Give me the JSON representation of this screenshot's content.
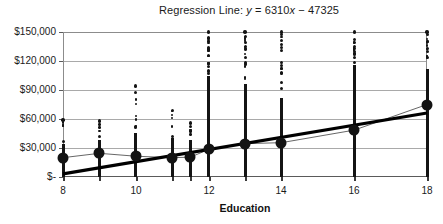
{
  "chart_data": {
    "type": "scatter",
    "title": "Regression Line: y = 6310x − 47325",
    "title_parts": {
      "prefix": "Regression Line: ",
      "y_var": "y",
      "equals": " = 6310",
      "x_var": "x",
      "suffix": " − 47325"
    },
    "xlabel": "Education",
    "ylabel": "",
    "xlim": [
      8,
      18
    ],
    "ylim": [
      0,
      150000
    ],
    "grid": true,
    "legend": false,
    "regression": {
      "slope": 6310,
      "intercept": -47325,
      "equation": "y = 6310x - 47325",
      "x_start": 8,
      "y_start": 3155,
      "x_end": 18,
      "y_end": 66255,
      "color": "#000000"
    },
    "xticks": [
      8,
      10,
      12,
      14,
      16,
      18
    ],
    "xtick_labels": [
      "8",
      "10",
      "12",
      "14",
      "16",
      "18"
    ],
    "xtick_marks_all": [
      8,
      9,
      10,
      11,
      11.5,
      12,
      13,
      14,
      16,
      18
    ],
    "yticks": [
      0,
      30000,
      60000,
      90000,
      120000,
      150000
    ],
    "ytick_labels": [
      "$-",
      "$30,000",
      "$60,000",
      "$90,000",
      "$120,000",
      "$150,000"
    ],
    "means": {
      "name": "Mean earnings by education",
      "x": [
        8,
        9,
        10,
        11,
        11.5,
        12,
        13,
        14,
        16,
        18
      ],
      "y": [
        20000,
        24500,
        21500,
        20000,
        20500,
        28500,
        34500,
        35500,
        48500,
        75000
      ],
      "marker_color": "#131313",
      "connector_color": "#555555"
    },
    "columns": [
      {
        "x": 8,
        "min": 0,
        "max": 59000,
        "dense_to": 34000,
        "n": 40
      },
      {
        "x": 9,
        "min": 0,
        "max": 58000,
        "dense_to": 38000,
        "n": 48
      },
      {
        "x": 10,
        "min": 0,
        "max": 94000,
        "dense_to": 46000,
        "n": 85
      },
      {
        "x": 11,
        "min": 0,
        "max": 69000,
        "dense_to": 40000,
        "n": 60
      },
      {
        "x": 11.5,
        "min": 0,
        "max": 56000,
        "dense_to": 38000,
        "n": 50
      },
      {
        "x": 12,
        "min": 0,
        "max": 150000,
        "dense_to": 104000,
        "n": 230
      },
      {
        "x": 13,
        "min": 0,
        "max": 150000,
        "dense_to": 96000,
        "n": 200
      },
      {
        "x": 14,
        "min": 0,
        "max": 150000,
        "dense_to": 82000,
        "n": 150
      },
      {
        "x": 16,
        "min": 0,
        "max": 150000,
        "dense_to": 116000,
        "n": 170
      },
      {
        "x": 18,
        "min": 0,
        "max": 150000,
        "dense_to": 112000,
        "n": 160
      }
    ]
  }
}
